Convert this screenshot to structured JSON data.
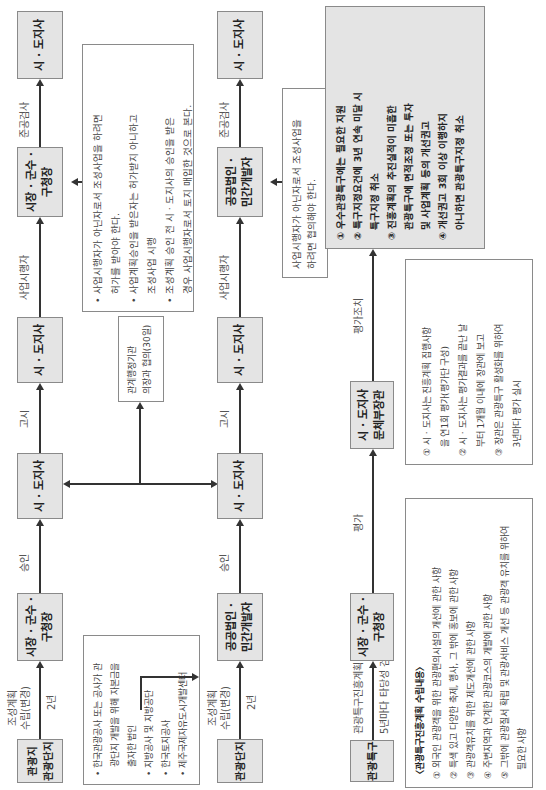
{
  "row1": {
    "boxes": [
      "관광지\n관광단지",
      "시장 · 군수 ·\n구청장",
      "시 · 도지사",
      "시 · 도지사",
      "시장 · 군수 ·\n구청장",
      "시 · 도지사"
    ],
    "arrow_labels": {
      "a1_top": "조성계획\n수립(변경)",
      "a1_bottom": "2년",
      "a2": "승인",
      "a3": "고시",
      "a4": "사업시행자",
      "a5": "준공검사"
    },
    "note": {
      "items": [
        "• 사업시행자가 아닌자로서 조성사업을 하려면",
        "   허가를 받아야 한다.",
        "• 사업계획승인을 받은자는 허가받지 아니하고",
        "   조성사업 시행",
        "• 조성계획 승인 전 시 · 도지사의 승인을 받은",
        "   경우 사업시행자로서 토지 매입한 것으로 본다."
      ]
    }
  },
  "consult_note": "관계행정기관\n의장과 협의(30일)",
  "developers_note": {
    "items": [
      "• 한국관광공사 또는 공사가 관",
      "   광단지 개발을 위해 자본금을",
      "   출자한 법인",
      "• 지방공사 및 지방공단",
      "• 한국토지공사",
      "• 제주국제자유도시개발센터"
    ]
  },
  "row2": {
    "boxes": [
      "관광단지",
      "공공법인 ·\n민간개발자",
      "시 · 도지사",
      "시 · 도지사",
      "공공법인 ·\n민간개발자",
      "시 · 도지사"
    ],
    "arrow_labels": {
      "a1_top": "조성계획\n수립(변경)",
      "a1_bottom": "2년",
      "a2": "승인",
      "a3": "고시",
      "a4": "사업시행자",
      "a5": "준공검사"
    },
    "note": "사업시행자가 아닌자로서 조성사업을\n하려면 협의해야 한다."
  },
  "row3": {
    "boxes": [
      "관광특구",
      "시장 · 군수 ·\n구청장",
      "시 · 도지사\n문체부장관"
    ],
    "arrow_labels": {
      "a1_top": "관광특구진흥계획",
      "a1_bottom": "5년마다 타당성 검토",
      "a2": "평가",
      "a3": "평가조치"
    },
    "result_box": {
      "items": [
        "① 우수관광특구에는 필요한 지원",
        "② 특구지정요건에 3년 연속 미달 시",
        "   특구지정 취소",
        "③ 진흥계획의 추진실적이 미흡한",
        "   관광특구에 면적조정 또는 투자",
        "   및 사업계획 등의 개선권고",
        "④ 개선권고 3회 이상 이행하지",
        "   아니하면 관광특구지정 취소"
      ]
    }
  },
  "plan_contents": {
    "title": "〈관광특구진흥계획 수립내용〉",
    "items": [
      "① 외국인 관광객을 위한 관광편의시설의 개선에 관한 사항",
      "② 특색 있고 다양한 축제, 행사, 그 밖에 홍보에 관한 사항",
      "③ 관광객유치를 위한 제도개선에 관한 사항",
      "④ 주변지역과 연계한 관광코스의 개발에 관한 사항",
      "⑤ 그밖에 관광질서 확립 및 관광서비스 개선 등 관광객 유치를 위하여",
      "   필요한 사항"
    ]
  },
  "evaluation_note": {
    "items": [
      "① 시 · 도지사는 진흥계획 집행사항",
      "   을 연1회 평가(평가단 구성)",
      "② 시 · 도지사는 평가결과를 끝난 날",
      "   부터 1개월 이내에 장관에 보고",
      "③ 장관은 관광특구 활성화를 위하여",
      "   3년마다 평가 실시"
    ]
  }
}
